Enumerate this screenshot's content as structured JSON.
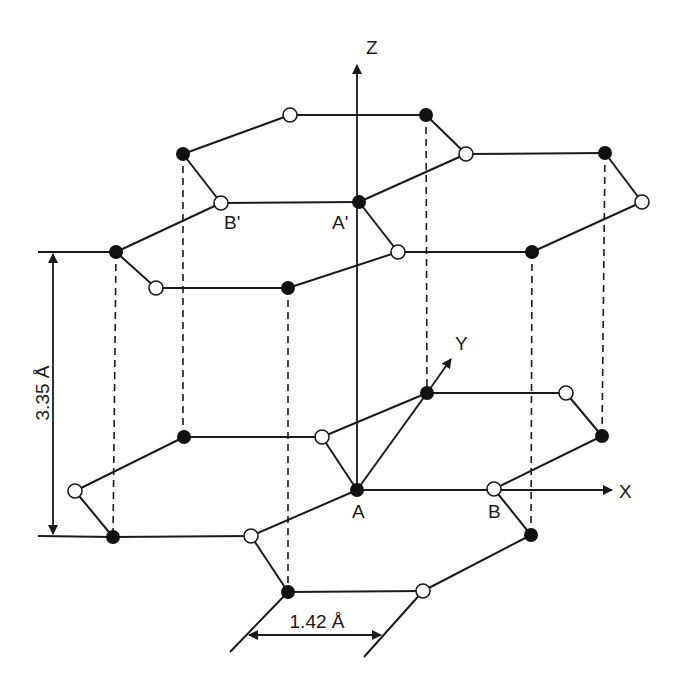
{
  "colors": {
    "line": "#1a1a1a",
    "atom_a": "#111111",
    "atom_b": "#ffffff",
    "background": "#ffffff"
  },
  "axes": {
    "z": {
      "label": "Z",
      "from": [
        357,
        490
      ],
      "to": [
        357,
        63
      ],
      "label_pos": [
        372,
        53
      ]
    },
    "x": {
      "label": "X",
      "from": [
        357,
        490
      ],
      "to": [
        613,
        490
      ],
      "label_pos": [
        627,
        498
      ]
    },
    "y": {
      "label": "Y",
      "from": [
        357,
        490
      ],
      "to": [
        452,
        358
      ],
      "label_pos": [
        462,
        350
      ]
    }
  },
  "atoms": {
    "upper": [
      {
        "id": "u1",
        "x": 290,
        "y": 115,
        "type": "open"
      },
      {
        "id": "u2",
        "x": 426,
        "y": 115,
        "type": "filled"
      },
      {
        "id": "u3",
        "x": 183,
        "y": 154,
        "type": "filled"
      },
      {
        "id": "u4",
        "x": 466,
        "y": 154,
        "type": "open"
      },
      {
        "id": "u5",
        "x": 605,
        "y": 153,
        "type": "filled"
      },
      {
        "id": "u6",
        "x": 221,
        "y": 203,
        "type": "open",
        "label": "B'"
      },
      {
        "id": "u7",
        "x": 359,
        "y": 202,
        "type": "filled",
        "label": "A'"
      },
      {
        "id": "u8",
        "x": 642,
        "y": 202,
        "type": "open"
      },
      {
        "id": "u9",
        "x": 116,
        "y": 252,
        "type": "filled"
      },
      {
        "id": "u10",
        "x": 398,
        "y": 252,
        "type": "open"
      },
      {
        "id": "u11",
        "x": 532,
        "y": 252,
        "type": "filled"
      },
      {
        "id": "u12",
        "x": 156,
        "y": 288,
        "type": "open"
      },
      {
        "id": "u13",
        "x": 288,
        "y": 288,
        "type": "filled"
      }
    ],
    "lower": [
      {
        "id": "l1",
        "x": 427,
        "y": 393,
        "type": "filled"
      },
      {
        "id": "l2",
        "x": 566,
        "y": 393,
        "type": "open"
      },
      {
        "id": "l3",
        "x": 184,
        "y": 437,
        "type": "filled"
      },
      {
        "id": "l4",
        "x": 322,
        "y": 437,
        "type": "open"
      },
      {
        "id": "l5",
        "x": 602,
        "y": 436,
        "type": "filled"
      },
      {
        "id": "l6",
        "x": 75,
        "y": 491,
        "type": "open"
      },
      {
        "id": "l7",
        "x": 357,
        "y": 490,
        "type": "filled",
        "label": "A"
      },
      {
        "id": "l8",
        "x": 494,
        "y": 489,
        "type": "open",
        "label": "B"
      },
      {
        "id": "l9",
        "x": 113,
        "y": 537,
        "type": "filled"
      },
      {
        "id": "l10",
        "x": 251,
        "y": 536,
        "type": "open"
      },
      {
        "id": "l11",
        "x": 531,
        "y": 535,
        "type": "filled"
      },
      {
        "id": "l12",
        "x": 288,
        "y": 592,
        "type": "filled"
      },
      {
        "id": "l13",
        "x": 423,
        "y": 591,
        "type": "open"
      }
    ]
  },
  "labels": {
    "a_prime": "A'",
    "b_prime": "B'",
    "a": "A",
    "b": "B",
    "z": "Z",
    "x": "X",
    "y": "Y",
    "interlayer_distance": "3.35 Å",
    "bond_length": "1.42 Å"
  },
  "dimensions": {
    "interlayer": {
      "value": "3.35 Å",
      "x": 53,
      "y_top": 252,
      "y_bottom": 536
    },
    "bond": {
      "value": "1.42 Å",
      "y": 635,
      "x_left": 247,
      "x_right": 382
    }
  }
}
